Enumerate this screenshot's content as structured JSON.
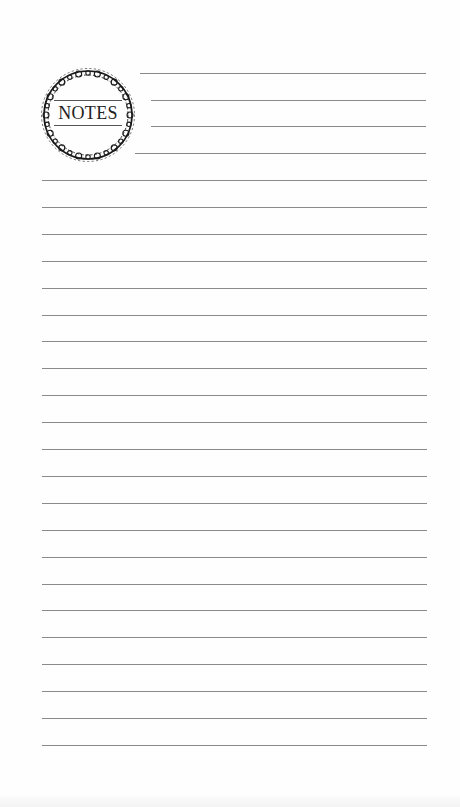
{
  "page": {
    "title": "NOTES",
    "background_color": "#fefefe",
    "line_color": "#8a8a8a",
    "ornament_color": "#1a1a1a"
  },
  "emblem": {
    "label": "NOTES",
    "icon": "ornamental-wreath-icon"
  },
  "lines": {
    "header_lines": [
      {
        "y": 73,
        "x_start": 140,
        "x_end": 426
      },
      {
        "y": 100,
        "x_start": 151,
        "x_end": 426
      },
      {
        "y": 126,
        "x_start": 151,
        "x_end": 426
      },
      {
        "y": 153,
        "x_start": 135,
        "x_end": 426
      }
    ],
    "body_line_count": 22,
    "body_first_y": 180,
    "spacing": 26.9,
    "body_x_start": 42,
    "body_x_end": 427
  }
}
